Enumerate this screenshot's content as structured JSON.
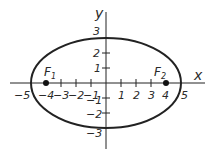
{
  "diagram": {
    "type": "ellipse-on-coordinate-plane",
    "colors": {
      "stroke": "#222222",
      "background": "#ffffff",
      "text": "#2a2a2a"
    },
    "axes": {
      "x_label": "x",
      "y_label": "y",
      "x_ticks": [
        {
          "value": -5,
          "label": "−5"
        },
        {
          "value": -4,
          "label": "−4"
        },
        {
          "value": -3,
          "label": "−3"
        },
        {
          "value": -2,
          "label": "−2"
        },
        {
          "value": -1,
          "label": "−1"
        },
        {
          "value": 1,
          "label": "1"
        },
        {
          "value": 2,
          "label": "2"
        },
        {
          "value": 3,
          "label": "3"
        },
        {
          "value": 4,
          "label": "4"
        },
        {
          "value": 5,
          "label": "5"
        }
      ],
      "y_ticks": [
        {
          "value": 3,
          "label": "3"
        },
        {
          "value": 2,
          "label": "2"
        },
        {
          "value": 1,
          "label": "1"
        },
        {
          "value": -1,
          "label": "−1"
        },
        {
          "value": -2,
          "label": "−2"
        },
        {
          "value": -3,
          "label": "−3"
        }
      ]
    },
    "ellipse": {
      "center": [
        0,
        0
      ],
      "semi_major_x": 5,
      "semi_minor_y": 3
    },
    "foci": [
      {
        "label": "F",
        "subscript": "1",
        "x": -4,
        "y": 0
      },
      {
        "label": "F",
        "subscript": "2",
        "x": 4,
        "y": 0
      }
    ]
  }
}
